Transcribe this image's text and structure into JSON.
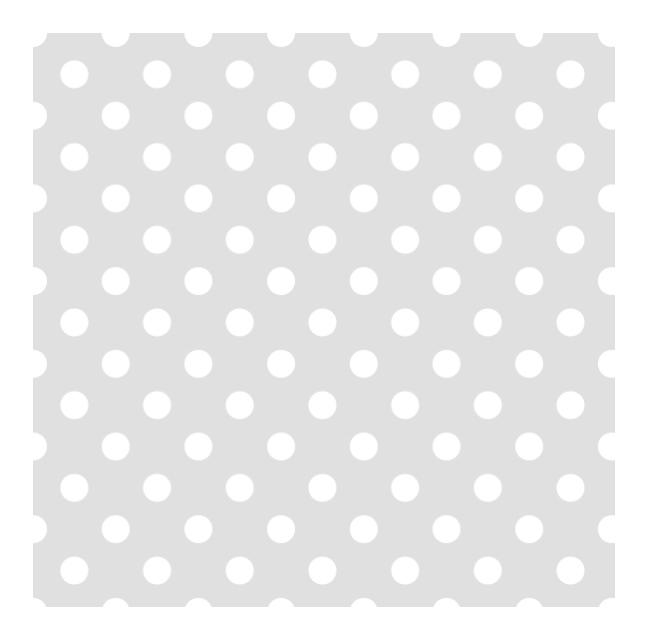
{
  "canvas": {
    "width": 652,
    "height": 640,
    "background_color": "#ffffff",
    "name": "polka-dot-swatch"
  },
  "panel": {
    "label": "Polka dot pattern swatch",
    "x": 33,
    "y": 33,
    "width": 582,
    "height": 574,
    "background_color": "#e0e0e0"
  },
  "pattern": {
    "type": "polka-dot",
    "dot_color": "#ffffff",
    "dot_diameter": 28,
    "dot_radius": 14,
    "pitch_x": 82.7,
    "pitch_y": 82.7,
    "row_offset_x": 41.35,
    "row_offset_y": 41.35,
    "arrangement": "staggered-offset-grid",
    "origin_aligned_to_corner": true,
    "edge_dots_clipped": true,
    "columns_primary": 8,
    "rows_primary": 8,
    "columns_offset": 7,
    "rows_offset": 7
  }
}
